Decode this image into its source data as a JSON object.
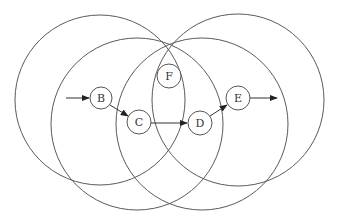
{
  "diagram": {
    "type": "overlapping-circles-with-node-path",
    "colors": {
      "background": "#ffffff",
      "stroke": "#5a5a5a",
      "node_stroke": "#555555",
      "text": "#333333"
    },
    "circles": [
      {
        "name": "upper-left-circle",
        "cx": 100,
        "cy": 100,
        "r": 85
      },
      {
        "name": "upper-right-circle",
        "cx": 238,
        "cy": 100,
        "r": 86
      },
      {
        "name": "lower-left-circle",
        "cx": 137,
        "cy": 124,
        "r": 86
      },
      {
        "name": "lower-right-circle",
        "cx": 202,
        "cy": 124,
        "r": 86
      }
    ],
    "nodes": [
      {
        "id": "B",
        "label": "B",
        "cx": 101,
        "cy": 98,
        "r": 11
      },
      {
        "id": "C",
        "label": "C",
        "cx": 139,
        "cy": 122,
        "r": 12
      },
      {
        "id": "D",
        "label": "D",
        "cx": 200,
        "cy": 123,
        "r": 12
      },
      {
        "id": "E",
        "label": "E",
        "cx": 238,
        "cy": 98,
        "r": 12
      },
      {
        "id": "F",
        "label": "F",
        "cx": 169,
        "cy": 76,
        "r": 12
      }
    ],
    "edges": [
      {
        "from": "start",
        "to": "B"
      },
      {
        "from": "B",
        "to": "C"
      },
      {
        "from": "C",
        "to": "D"
      },
      {
        "from": "D",
        "to": "E"
      },
      {
        "from": "E",
        "to": "end"
      }
    ]
  }
}
